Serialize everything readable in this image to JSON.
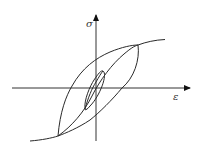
{
  "diagram": {
    "type": "stress-strain hysteresis loops",
    "y_axis_label": "σ",
    "x_axis_label": "ε",
    "colors": {
      "stroke": "#2a2a2a",
      "background": "#ffffff"
    },
    "elements": [
      "backbone curve",
      "large hysteresis loop",
      "small hysteresis loop"
    ]
  }
}
